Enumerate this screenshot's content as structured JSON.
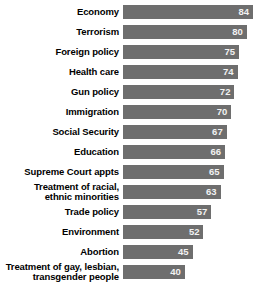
{
  "chart_data": {
    "type": "bar",
    "orientation": "horizontal",
    "title": "",
    "subtitle": "",
    "xlabel": "",
    "ylabel": "",
    "xlim": [
      0,
      84
    ],
    "grid": false,
    "legend": null,
    "bar_color": "#6e6e6e",
    "value_label_color": "#f2f2f2",
    "background_color": "#ffffff",
    "categories": [
      "Economy",
      "Terrorism",
      "Foreign policy",
      "Health care",
      "Gun policy",
      "Immigration",
      "Social Security",
      "Education",
      "Supreme Court appts",
      "Treatment of racial,\nethnic minorities",
      "Trade policy",
      "Environment",
      "Abortion",
      "Treatment of gay, lesbian,\ntransgender people"
    ],
    "values": [
      84,
      80,
      75,
      74,
      72,
      70,
      67,
      66,
      65,
      63,
      57,
      52,
      45,
      40
    ],
    "bars": [
      {
        "label": "Economy",
        "value": 84,
        "value_text": "84"
      },
      {
        "label": "Terrorism",
        "value": 80,
        "value_text": "80"
      },
      {
        "label": "Foreign policy",
        "value": 75,
        "value_text": "75"
      },
      {
        "label": "Health care",
        "value": 74,
        "value_text": "74"
      },
      {
        "label": "Gun policy",
        "value": 72,
        "value_text": "72"
      },
      {
        "label": "Immigration",
        "value": 70,
        "value_text": "70"
      },
      {
        "label": "Social Security",
        "value": 67,
        "value_text": "67"
      },
      {
        "label": "Education",
        "value": 66,
        "value_text": "66"
      },
      {
        "label": "Supreme Court appts",
        "value": 65,
        "value_text": "65"
      },
      {
        "label": "Treatment of racial,\nethnic minorities",
        "value": 63,
        "value_text": "63"
      },
      {
        "label": "Trade policy",
        "value": 57,
        "value_text": "57"
      },
      {
        "label": "Environment",
        "value": 52,
        "value_text": "52"
      },
      {
        "label": "Abortion",
        "value": 45,
        "value_text": "45"
      },
      {
        "label": "Treatment of gay, lesbian,\ntransgender people",
        "value": 40,
        "value_text": "40"
      }
    ]
  }
}
